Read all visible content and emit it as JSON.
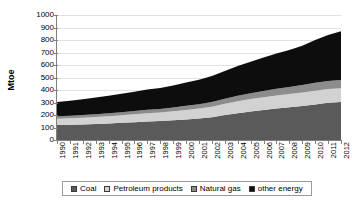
{
  "chart_data": {
    "type": "area",
    "stacked": true,
    "title": "",
    "xlabel": "",
    "ylabel": "Mtoe",
    "ylim": [
      0,
      1000
    ],
    "ytick_step": 100,
    "yticks": [
      1000,
      900,
      800,
      700,
      600,
      500,
      400,
      300,
      200,
      100,
      0
    ],
    "grid": true,
    "legend_position": "bottom",
    "categories": [
      1990,
      1991,
      1992,
      1993,
      1994,
      1995,
      1996,
      1997,
      1998,
      1999,
      2000,
      2001,
      2002,
      2003,
      2004,
      2005,
      2006,
      2007,
      2008,
      2009,
      2010,
      2011,
      2012
    ],
    "xtick_labels": [
      "1990",
      "1991",
      "1992",
      "1993",
      "1994",
      "1995",
      "1996",
      "1997",
      "1998",
      "1999",
      "2000",
      "2001",
      "2002",
      "2003",
      "2004",
      "2005",
      "2006",
      "2007",
      "2008",
      "2009",
      "2010",
      "2011",
      "2012"
    ],
    "series": [
      {
        "name": "Coal",
        "color": "#5a5a5a",
        "values": [
          120,
          122,
          124,
          128,
          133,
          138,
          143,
          148,
          152,
          158,
          165,
          172,
          182,
          200,
          215,
          228,
          240,
          252,
          262,
          272,
          285,
          298,
          305
        ]
      },
      {
        "name": "Petroleum products",
        "color": "#d2d2d2",
        "values": [
          50,
          52,
          54,
          56,
          58,
          60,
          63,
          66,
          68,
          72,
          76,
          80,
          85,
          90,
          96,
          100,
          103,
          105,
          106,
          108,
          110,
          110,
          110
        ]
      },
      {
        "name": "Natural gas",
        "color": "#8c8c8c",
        "values": [
          20,
          21,
          22,
          23,
          24,
          25,
          26,
          28,
          29,
          31,
          33,
          35,
          37,
          40,
          43,
          46,
          50,
          54,
          57,
          60,
          63,
          65,
          65
        ]
      },
      {
        "name": "other energy",
        "color": "#0d0d0d",
        "values": [
          115,
          120,
          127,
          133,
          140,
          147,
          155,
          162,
          168,
          176,
          186,
          196,
          208,
          222,
          238,
          253,
          268,
          282,
          296,
          315,
          342,
          368,
          390
        ]
      }
    ],
    "totals": [
      305,
      315,
      327,
      340,
      355,
      370,
      387,
      404,
      417,
      437,
      460,
      483,
      512,
      552,
      592,
      627,
      661,
      693,
      721,
      755,
      800,
      841,
      870
    ]
  },
  "legend": {
    "items": [
      {
        "label": "Coal",
        "icon": "square-swatch-icon"
      },
      {
        "label": "Petroleum products",
        "icon": "square-swatch-icon"
      },
      {
        "label": "Natural gas",
        "icon": "square-swatch-icon"
      },
      {
        "label": "other energy",
        "icon": "square-swatch-icon"
      }
    ]
  },
  "axis": {
    "y_title": "Mtoe"
  }
}
